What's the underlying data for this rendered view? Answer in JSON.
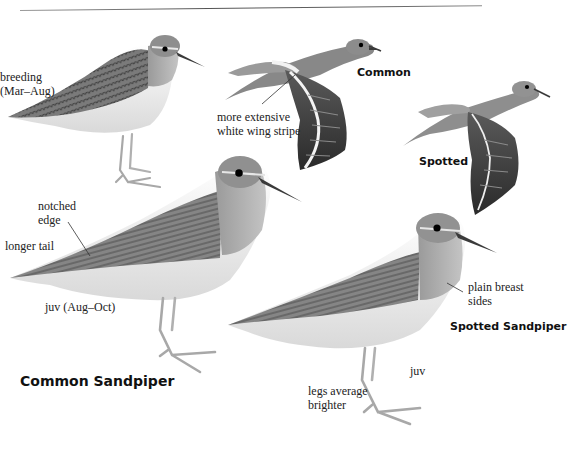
{
  "page": {
    "type": "field-guide-plate",
    "palette": {
      "background": "#ffffff",
      "upperparts": "#7d7d7d",
      "upperparts_dark": "#4a4a4a",
      "underparts": "#f2f2f2",
      "breast": "#a9a9a9",
      "legs": "#b5b5b5",
      "bill": "#3a3a3a",
      "eye": "#000000",
      "text": "#222222"
    }
  },
  "species": [
    {
      "name": "Common Sandpiper",
      "figures": [
        {
          "id": "common-breeding",
          "caption": "breeding",
          "caption2": "(Mar–Aug)",
          "pose": "standing"
        },
        {
          "id": "common-flight",
          "caption": "Common",
          "pose": "flight",
          "annotation": {
            "line1": "more extensive",
            "line2": "white wing stripe"
          }
        },
        {
          "id": "common-juv",
          "caption": "juv (Aug–Oct)",
          "pose": "standing",
          "annotations": [
            {
              "line1": "notched",
              "line2": "edge"
            },
            {
              "line1": "longer tail"
            }
          ]
        }
      ]
    },
    {
      "name": "Spotted Sandpiper",
      "figures": [
        {
          "id": "spotted-flight",
          "caption": "Spotted",
          "pose": "flight"
        },
        {
          "id": "spotted-juv",
          "caption": "juv",
          "pose": "standing",
          "annotations": [
            {
              "line1": "plain breast",
              "line2": "sides"
            },
            {
              "line1": "legs average",
              "line2": "brighter"
            }
          ]
        }
      ]
    }
  ],
  "labels": {
    "breeding": "breeding",
    "breeding_dates": "(Mar–Aug)",
    "common_flight": "Common",
    "wing_stripe_1": "more extensive",
    "wing_stripe_2": "white wing stripe",
    "spotted_flight": "Spotted",
    "notched_1": "notched",
    "notched_2": "edge",
    "longer_tail": "longer tail",
    "juv_common": "juv (Aug–Oct)",
    "common_title": "Common Sandpiper",
    "plain_breast_1": "plain breast",
    "plain_breast_2": "sides",
    "spotted_title": "Spotted Sandpiper",
    "juv_spotted": "juv",
    "legs_1": "legs average",
    "legs_2": "brighter"
  }
}
